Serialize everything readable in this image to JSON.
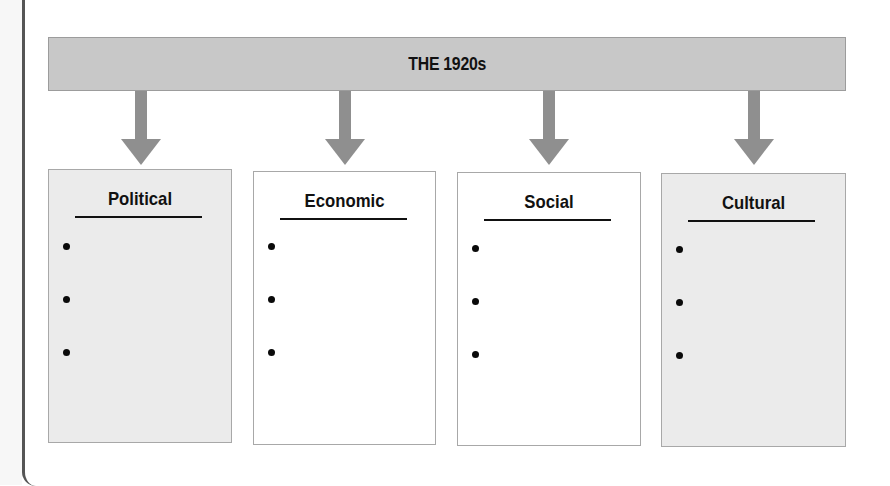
{
  "diagram": {
    "title": "THE 1920s",
    "categories": [
      {
        "heading": "Political",
        "shaded": true,
        "bullets": [
          "",
          "",
          ""
        ]
      },
      {
        "heading": "Economic",
        "shaded": false,
        "bullets": [
          "",
          "",
          ""
        ]
      },
      {
        "heading": "Social",
        "shaded": false,
        "bullets": [
          "",
          "",
          ""
        ]
      },
      {
        "heading": "Cultural",
        "shaded": true,
        "bullets": [
          "",
          "",
          ""
        ]
      }
    ],
    "colors": {
      "bar": "#c8c8c8",
      "arrow": "#8f8f8f",
      "shaded_box": "#ebebeb",
      "text": "#111111"
    }
  }
}
